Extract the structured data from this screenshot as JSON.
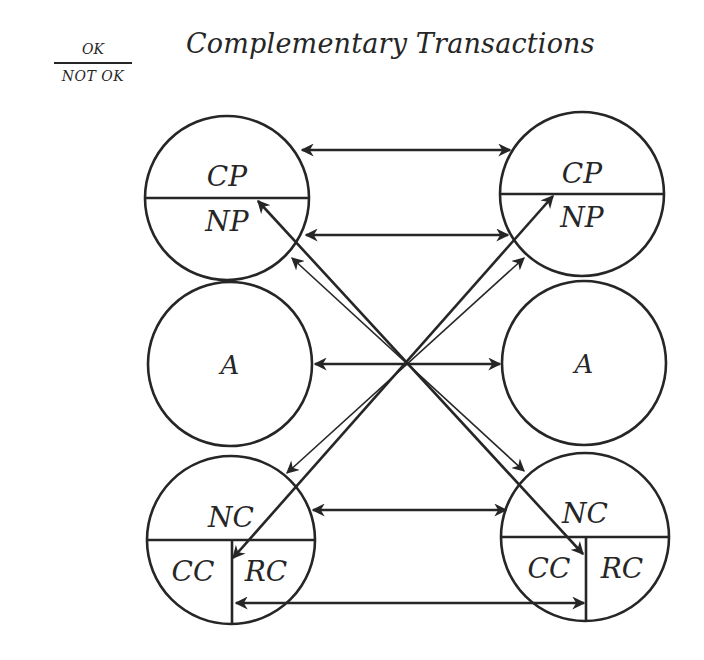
{
  "title": "Complementary Transactions",
  "legend": {
    "top": "OK",
    "bottom": "NOT OK"
  },
  "colors": {
    "ink": "#262626",
    "background": "#ffffff"
  },
  "circles": [
    {
      "id": "left-parent",
      "cx": 227,
      "cy": 198,
      "r": 82,
      "divider": "horizontal",
      "labels": [
        {
          "text": "CP",
          "x": 227,
          "y": 186,
          "size": 28
        },
        {
          "text": "NP",
          "x": 227,
          "y": 231,
          "size": 28
        }
      ]
    },
    {
      "id": "left-adult",
      "cx": 230,
      "cy": 364,
      "r": 82,
      "divider": "none",
      "labels": [
        {
          "text": "A",
          "x": 230,
          "y": 374,
          "size": 26
        }
      ]
    },
    {
      "id": "left-child",
      "cx": 231,
      "cy": 540,
      "r": 84,
      "divider": "tee",
      "labels": [
        {
          "text": "NC",
          "x": 231,
          "y": 527,
          "size": 28
        },
        {
          "text": "CC",
          "x": 193,
          "y": 581,
          "size": 28
        },
        {
          "text": "RC",
          "x": 266,
          "y": 581,
          "size": 28
        }
      ]
    },
    {
      "id": "right-parent",
      "cx": 582,
      "cy": 194,
      "r": 82,
      "divider": "horizontal",
      "labels": [
        {
          "text": "CP",
          "x": 582,
          "y": 183,
          "size": 28
        },
        {
          "text": "NP",
          "x": 582,
          "y": 227,
          "size": 28
        }
      ]
    },
    {
      "id": "right-adult",
      "cx": 584,
      "cy": 363,
      "r": 82,
      "divider": "none",
      "labels": [
        {
          "text": "A",
          "x": 584,
          "y": 373,
          "size": 26
        }
      ]
    },
    {
      "id": "right-child",
      "cx": 585,
      "cy": 537,
      "r": 84,
      "divider": "tee",
      "labels": [
        {
          "text": "NC",
          "x": 585,
          "y": 523,
          "size": 28
        },
        {
          "text": "CC",
          "x": 549,
          "y": 578,
          "size": 28
        },
        {
          "text": "RC",
          "x": 622,
          "y": 578,
          "size": 28
        }
      ]
    }
  ],
  "arrows": [
    {
      "id": "cp-cp",
      "x1": 302,
      "y1": 150,
      "x2": 510,
      "y2": 150,
      "heads": "both",
      "width": 2.6
    },
    {
      "id": "np-np",
      "x1": 306,
      "y1": 235,
      "x2": 508,
      "y2": 235,
      "heads": "both",
      "width": 2.6
    },
    {
      "id": "a-a",
      "x1": 315,
      "y1": 364,
      "x2": 500,
      "y2": 364,
      "heads": "both",
      "width": 2.6
    },
    {
      "id": "nc-nc",
      "x1": 313,
      "y1": 510,
      "x2": 506,
      "y2": 510,
      "heads": "both",
      "width": 2.6
    },
    {
      "id": "rc-cc",
      "x1": 236,
      "y1": 603,
      "x2": 584,
      "y2": 603,
      "heads": "both",
      "width": 2.6
    },
    {
      "id": "np-left-to-cc-right",
      "x1": 258,
      "y1": 201,
      "x2": 583,
      "y2": 554,
      "heads": "both",
      "width": 2.6
    },
    {
      "id": "np-right-to-rc-left",
      "x1": 553,
      "y1": 196,
      "x2": 233,
      "y2": 558,
      "heads": "both",
      "width": 2.6
    },
    {
      "id": "thin-left-up-right-down",
      "x1": 292,
      "y1": 258,
      "x2": 524,
      "y2": 471,
      "heads": "both",
      "width": 1.6
    },
    {
      "id": "thin-right-up-left-down",
      "x1": 524,
      "y1": 258,
      "x2": 287,
      "y2": 473,
      "heads": "both",
      "width": 1.6
    }
  ]
}
